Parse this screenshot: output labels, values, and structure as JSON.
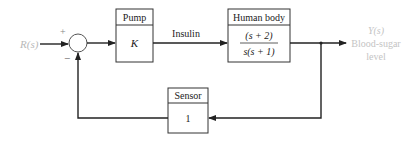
{
  "diagram": {
    "input": {
      "label": "R(s)",
      "color": "#b8b8b8"
    },
    "summing_junction": {
      "plus_sign": "+",
      "minus_sign": "−"
    },
    "pump": {
      "title": "Pump",
      "gain": "K"
    },
    "signal_label": "Insulin",
    "human_body": {
      "title": "Human body",
      "numerator": "(s + 2)",
      "denominator": "s(s + 1)"
    },
    "output": {
      "label": "Y(s)",
      "line1": "Blood-sugar",
      "line2": "level",
      "color": "#c4c4c4"
    },
    "sensor": {
      "title": "Sensor",
      "gain": "1"
    },
    "colors": {
      "line": "#222222",
      "box_border": "#333333"
    }
  }
}
